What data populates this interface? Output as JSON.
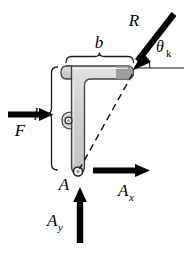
{
  "figure": {
    "background_color": "#ffffff",
    "line_color": "#000000",
    "body_fill": "#cfcfcf",
    "body_fill_dark": "#9a9a9a",
    "body_stroke": "#3a3a3a"
  },
  "labels": {
    "force_R": "R",
    "angle_theta": "θ",
    "angle_theta_sub": "k",
    "force_F": "F",
    "dim_b": "b",
    "dim_h": "h",
    "point_A": "A",
    "reaction_Ax": "A",
    "reaction_Ax_sub": "x",
    "reaction_Ay": "A",
    "reaction_Ay_sub": "y"
  },
  "elements": {
    "bracket": {
      "name": "L-shaped bracket",
      "corner_top_right": [
        133,
        72
      ],
      "pin_A": [
        78,
        172
      ],
      "pin_middle": [
        68,
        120
      ]
    },
    "forces": [
      {
        "name": "R",
        "label": "R",
        "type": "applied-load",
        "direction": "down-left",
        "tail": [
          175,
          18
        ],
        "head": [
          134,
          70
        ],
        "angle_from_horizontal_label": "θk"
      },
      {
        "name": "F",
        "label": "F",
        "type": "applied-load",
        "direction": "right",
        "tail": [
          8,
          115
        ],
        "head": [
          53,
          115
        ]
      },
      {
        "name": "Ax",
        "label": "Ax",
        "type": "reaction",
        "direction": "right",
        "tail": [
          93,
          171
        ],
        "head": [
          150,
          171
        ]
      },
      {
        "name": "Ay",
        "label": "Ay",
        "type": "reaction",
        "direction": "up",
        "tail": [
          80,
          243
        ],
        "head": [
          80,
          187
        ]
      }
    ],
    "dimensions": [
      {
        "name": "b",
        "label": "b",
        "orientation": "horizontal",
        "span_from": [
          66,
          58
        ],
        "span_to": [
          133,
          58
        ]
      },
      {
        "name": "h",
        "label": "h",
        "orientation": "vertical",
        "span_from": [
          53,
          68
        ],
        "span_to": [
          53,
          170
        ]
      }
    ],
    "construction_lines": [
      {
        "name": "dashed-diagonal",
        "style": "dashed",
        "from": [
          133,
          73
        ],
        "to": [
          79,
          171
        ]
      },
      {
        "name": "horizontal-reference",
        "style": "solid",
        "from": [
          134,
          68
        ],
        "to": [
          184,
          68
        ]
      }
    ]
  }
}
